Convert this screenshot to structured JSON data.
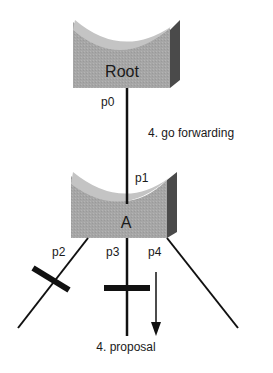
{
  "diagram": {
    "type": "spanning-tree-topology",
    "switches": [
      {
        "id": "root",
        "label": "Root"
      },
      {
        "id": "a",
        "label": "A"
      }
    ],
    "ports": {
      "p0": "p0",
      "p1": "p1",
      "p2": "p2",
      "p3": "p3",
      "p4": "p4"
    },
    "annotations": {
      "go_forwarding": "4. go forwarding",
      "proposal": "4. proposal"
    },
    "blocked_ports": [
      "p2",
      "p3"
    ],
    "colors": {
      "switch_front": "#a8a8a8",
      "switch_top": "#c8c8c8",
      "switch_side": "#4a4a4a",
      "line": "#111111",
      "block_bar": "#111111"
    }
  }
}
